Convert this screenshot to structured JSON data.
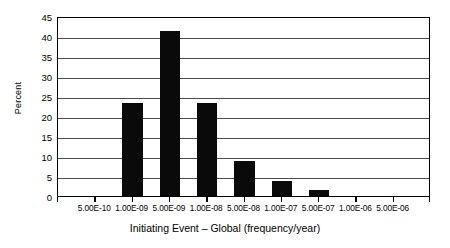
{
  "chart_data": {
    "type": "bar",
    "title": "",
    "xlabel": "Initiating Event – Global (frequency/year)",
    "ylabel": "Percent",
    "categories": [
      "5.00E-10",
      "1.00E-09",
      "5.00E-09",
      "1.00E-08",
      "5.00E-08",
      "1.00E-07",
      "5.00E-07",
      "1.00E-06",
      "5.00E-06"
    ],
    "values": [
      0,
      23.2,
      41.3,
      23.2,
      8.8,
      3.8,
      1.5,
      0,
      0
    ],
    "ylim": [
      0,
      45
    ],
    "yticks": [
      0,
      5,
      10,
      15,
      20,
      25,
      30,
      35,
      40,
      45
    ],
    "ytick_labels": [
      "0",
      "5",
      "10",
      "15",
      "20",
      "25",
      "30",
      "35",
      "40",
      "45"
    ],
    "grid": "horizontal",
    "legend": "none",
    "bar_color": "#0a0a0a",
    "gridline_color": "#4a4a4a",
    "axis_color": "#000000",
    "background_color": "#ffffff"
  }
}
